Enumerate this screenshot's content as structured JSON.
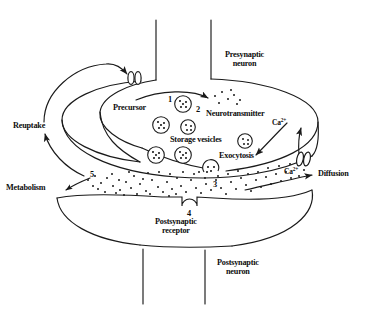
{
  "figure": {
    "width": 366,
    "height": 313,
    "line_color": "#1a1a1a",
    "background_color": "#ffffff",
    "text_color": "#0d0d0d"
  },
  "labels": {
    "presynaptic_neuron_line1": "Presynaptic",
    "presynaptic_neuron_line2": "neuron",
    "postsynaptic_neuron_line1": "Postsynaptic",
    "postsynaptic_neuron_line2": "neuron",
    "postsynaptic_receptor_line1": "Postsynaptic",
    "postsynaptic_receptor_line2": "receptor",
    "precursor": "Precursor",
    "neurotransmitter": "Neurotransmitter",
    "storage_vesicles": "Storage vesicles",
    "exocytosis": "Exocytosis",
    "reuptake": "Reuptake",
    "metabolism": "Metabolism",
    "diffusion": "Diffusion",
    "calcium_top": "Ca",
    "calcium_top_charge": "2+",
    "calcium_bottom": "Ca",
    "calcium_bottom_charge": "2+"
  },
  "step_numbers": {
    "step1": "1",
    "step2": "2",
    "step3": "3",
    "step4": "4",
    "step5": "5"
  },
  "elements": {
    "vesicles": [
      {
        "cx": 183,
        "cy": 104,
        "r": 8.5,
        "name": "storage-vesicle-1"
      },
      {
        "cx": 161,
        "cy": 125,
        "r": 8.5,
        "name": "storage-vesicle-2"
      },
      {
        "cx": 188,
        "cy": 127,
        "r": 7.5,
        "name": "storage-vesicle-3"
      },
      {
        "cx": 156,
        "cy": 155,
        "r": 8.5,
        "name": "storage-vesicle-4"
      },
      {
        "cx": 183,
        "cy": 155,
        "r": 8.5,
        "name": "storage-vesicle-5"
      },
      {
        "cx": 245,
        "cy": 141,
        "r": 7.5,
        "name": "storage-vesicle-6"
      },
      {
        "cx": 211,
        "cy": 169,
        "r": 8.0,
        "name": "fusing-vesicle"
      }
    ],
    "reuptake_transporter": {
      "x": 134,
      "y": 78,
      "name": "reuptake-transporter"
    },
    "calcium_channel": {
      "x": 300,
      "y": 152,
      "name": "calcium-channel"
    },
    "receptor_notch": {
      "x": 188,
      "y": 200,
      "name": "postsynaptic-receptor-notch"
    }
  }
}
